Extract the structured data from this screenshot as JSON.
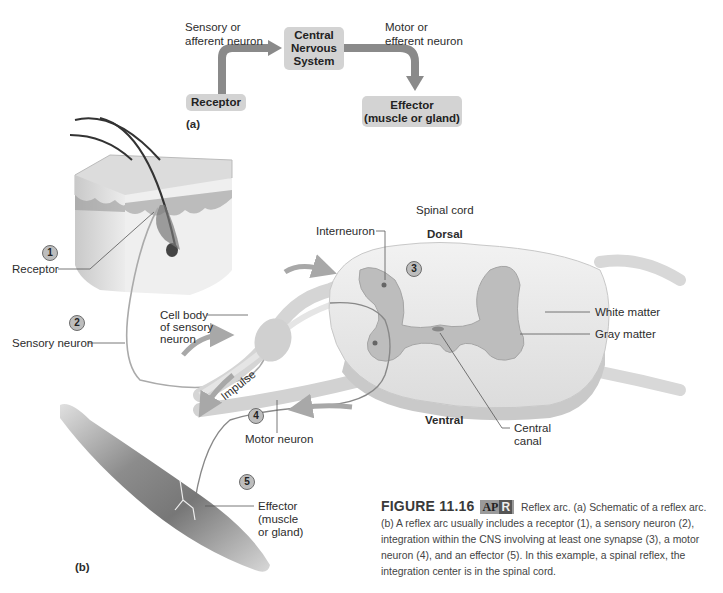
{
  "panel_a": {
    "label": "(a)",
    "boxes": {
      "receptor": "Receptor",
      "cns_line1": "Central",
      "cns_line2": "Nervous",
      "cns_line3": "System",
      "effector_line1": "Effector",
      "effector_line2": "(muscle or gland)"
    },
    "arrow_labels": {
      "sensory_line1": "Sensory or",
      "sensory_line2": "afferent neuron",
      "motor_line1": "Motor or",
      "motor_line2": "efferent neuron"
    },
    "colors": {
      "box": "#d3d3d3",
      "arrow": "#8a8a8a"
    }
  },
  "panel_b": {
    "label": "(b)",
    "numbers": [
      "1",
      "2",
      "3",
      "4",
      "5"
    ],
    "labels": {
      "receptor": "Receptor",
      "sensory_neuron": "Sensory neuron",
      "cell_body_line1": "Cell body",
      "cell_body_line2": "of sensory",
      "cell_body_line3": "neuron",
      "interneuron": "Interneuron",
      "spinal_cord": "Spinal cord",
      "dorsal": "Dorsal",
      "ventral": "Ventral",
      "white_matter": "White matter",
      "gray_matter": "Gray matter",
      "central_canal_line1": "Central",
      "central_canal_line2": "canal",
      "impulse": "Impulse",
      "motor_neuron": "Motor neuron",
      "effector_line1": "Effector",
      "effector_line2": "(muscle",
      "effector_line3": "or gland)"
    }
  },
  "caption": {
    "figure_number": "FIGURE 11.16",
    "badge_ap": "AP",
    "badge_r": "R",
    "text": "Reflex arc. (a) Schematic of a reflex arc. (b) A reflex arc usually includes a receptor (1), a sensory neuron (2), integration within the CNS involving at least one synapse (3), a motor neuron (4), and an effector (5). In this example, a spinal reflex, the integration center is in the spinal cord."
  }
}
